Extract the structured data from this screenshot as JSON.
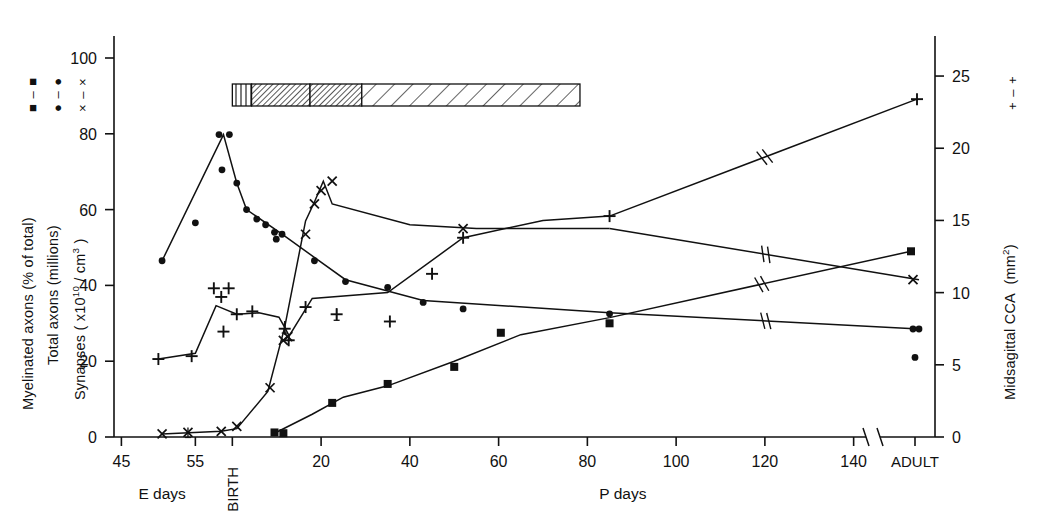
{
  "figure": {
    "background": "#ffffff",
    "ink": "#111111"
  },
  "axes": {
    "left": {
      "label_lines": [
        {
          "text": "Myelinated axons ( % of total )",
          "key": "square"
        },
        {
          "text": "Total axons (millions)",
          "key": "circle"
        },
        {
          "text": "Synapses ( x10^10 / cm^3 )",
          "key": "cross"
        }
      ],
      "ticks": [
        0,
        20,
        40,
        60,
        80,
        100
      ],
      "min": 0,
      "max": 105
    },
    "right": {
      "label": "Midsagittal CCA",
      "label_units": "(mm2)",
      "key": "plus",
      "ticks": [
        0,
        5,
        10,
        15,
        20,
        25
      ],
      "min": 0,
      "max": 26.25
    },
    "bottom": {
      "embryonic_label": "E days",
      "postnatal_label": "P days",
      "birth_label": "BIRTH",
      "adult_label": "ADULT",
      "e_ticks": [
        45,
        55
      ],
      "p_ticks": [
        20,
        40,
        60,
        80,
        100,
        120,
        140
      ],
      "has_break": true
    }
  },
  "legend_keys": {
    "square": "■ – ■",
    "circle": "● – ●",
    "cross": "× – ×",
    "plus": "+ – +"
  },
  "chart_data": {
    "type": "scatter",
    "title": "",
    "xlabel": "E days / P days",
    "ylabel": "Myelinated axons (% of total); Total axons (millions); Synapses (x10^10/cm^3)",
    "y2label": "Midsagittal CCA (mm2)",
    "xlim": [
      43,
      155
    ],
    "ylim": [
      0,
      105
    ],
    "y2lim": [
      0,
      26.25
    ],
    "grid": false,
    "legend_position": "left-rotated",
    "x_axis_note": "Embryonic days 45-55 then birth then postnatal days 0-150, axis break before ADULT",
    "series": [
      {
        "name": "Total axons (millions)",
        "marker": "circle",
        "axis": "left",
        "points": [
          {
            "x": 50.5,
            "y": 46.5
          },
          {
            "x": 55.0,
            "y": 56.5
          },
          {
            "x": 58.2,
            "y": 79.8
          },
          {
            "x": 59.6,
            "y": 79.8
          },
          {
            "x": 58.6,
            "y": 70.5
          },
          {
            "x": 61.0,
            "y": 67.0
          },
          {
            "x": 63.2,
            "y": 60.0
          },
          {
            "x": 65.5,
            "y": 57.5
          },
          {
            "x": 67.5,
            "y": 56.0
          },
          {
            "x": 69.5,
            "y": 54.0
          },
          {
            "x": 69.9,
            "y": 52.2
          },
          {
            "x": 71.2,
            "y": 53.5
          },
          {
            "x": 78.5,
            "y": 46.5
          },
          {
            "x": 85.5,
            "y": 41.0
          },
          {
            "x": 95.0,
            "y": 39.5
          },
          {
            "x": 103.0,
            "y": 35.5
          },
          {
            "x": 112.0,
            "y": 33.8
          },
          {
            "x": 145.0,
            "y": 32.5
          },
          {
            "x": 152.5,
            "y": 28.5
          },
          {
            "x": 154.0,
            "y": 28.5
          },
          {
            "x": 153.0,
            "y": 21.0
          }
        ],
        "line_through": [
          {
            "x": 50.5,
            "y": 46.5
          },
          {
            "x": 58.8,
            "y": 79.8
          },
          {
            "x": 61.0,
            "y": 67.0
          },
          {
            "x": 63.2,
            "y": 60.0
          },
          {
            "x": 71.2,
            "y": 53.5
          },
          {
            "x": 85.5,
            "y": 41.5
          },
          {
            "x": 103.0,
            "y": 36.0
          },
          {
            "x": 145.0,
            "y": 32.8
          },
          {
            "x": 154.0,
            "y": 28.5
          }
        ]
      },
      {
        "name": "Synapses (x10^10/cm^3)",
        "marker": "cross",
        "axis": "left",
        "points": [
          {
            "x": 50.5,
            "y": 0.8
          },
          {
            "x": 54.0,
            "y": 1.2
          },
          {
            "x": 58.5,
            "y": 1.5
          },
          {
            "x": 61.0,
            "y": 2.8
          },
          {
            "x": 68.5,
            "y": 13.0
          },
          {
            "x": 71.5,
            "y": 25.5
          },
          {
            "x": 72.5,
            "y": 26.5
          },
          {
            "x": 76.5,
            "y": 53.5
          },
          {
            "x": 78.5,
            "y": 61.5
          },
          {
            "x": 80.0,
            "y": 65.0
          },
          {
            "x": 82.5,
            "y": 67.5
          },
          {
            "x": 112.0,
            "y": 55.0
          },
          {
            "x": 152.5,
            "y": 41.5
          }
        ],
        "line_through": [
          {
            "x": 50.5,
            "y": 0.8
          },
          {
            "x": 58.5,
            "y": 1.5
          },
          {
            "x": 61.0,
            "y": 2.2
          },
          {
            "x": 68.0,
            "y": 12.0
          },
          {
            "x": 71.8,
            "y": 29.0
          },
          {
            "x": 76.5,
            "y": 57.0
          },
          {
            "x": 78.5,
            "y": 62.0
          },
          {
            "x": 80.5,
            "y": 67.5
          },
          {
            "x": 82.5,
            "y": 61.5
          },
          {
            "x": 100.0,
            "y": 56.0
          },
          {
            "x": 115.0,
            "y": 55.0
          },
          {
            "x": 145.0,
            "y": 55.0
          },
          {
            "x": 154.0,
            "y": 41.5
          }
        ]
      },
      {
        "name": "Myelinated axons (% of total)",
        "marker": "square",
        "axis": "left",
        "points": [
          {
            "x": 69.5,
            "y": 1.2
          },
          {
            "x": 71.5,
            "y": 1.0
          },
          {
            "x": 82.5,
            "y": 9.0
          },
          {
            "x": 95.0,
            "y": 14.0
          },
          {
            "x": 110.0,
            "y": 18.5
          },
          {
            "x": 120.5,
            "y": 27.5
          },
          {
            "x": 145.0,
            "y": 30.0
          },
          {
            "x": 152.0,
            "y": 49.0
          }
        ],
        "line_through": [
          {
            "x": 69.5,
            "y": 1.0
          },
          {
            "x": 78.0,
            "y": 6.0
          },
          {
            "x": 85.0,
            "y": 10.5
          },
          {
            "x": 95.0,
            "y": 13.5
          },
          {
            "x": 110.0,
            "y": 20.0
          },
          {
            "x": 125.0,
            "y": 27.0
          },
          {
            "x": 145.0,
            "y": 31.5
          },
          {
            "x": 152.0,
            "y": 49.0
          }
        ]
      },
      {
        "name": "Midsagittal CCA (mm2)",
        "marker": "plus",
        "axis": "right",
        "points": [
          {
            "x": 50.0,
            "y": 5.4
          },
          {
            "x": 54.5,
            "y": 5.6
          },
          {
            "x": 57.5,
            "y": 10.3
          },
          {
            "x": 59.5,
            "y": 10.3
          },
          {
            "x": 58.5,
            "y": 9.7
          },
          {
            "x": 58.8,
            "y": 7.3
          },
          {
            "x": 61.0,
            "y": 8.5
          },
          {
            "x": 64.5,
            "y": 8.7
          },
          {
            "x": 71.8,
            "y": 7.5
          },
          {
            "x": 72.7,
            "y": 6.7
          },
          {
            "x": 76.5,
            "y": 9.0
          },
          {
            "x": 83.5,
            "y": 8.5
          },
          {
            "x": 95.5,
            "y": 8.0
          },
          {
            "x": 105.0,
            "y": 11.3
          },
          {
            "x": 112.0,
            "y": 13.8
          },
          {
            "x": 145.0,
            "y": 15.3
          },
          {
            "x": 153.5,
            "y": 23.4
          }
        ],
        "line_through": [
          {
            "x": 50.0,
            "y": 5.4
          },
          {
            "x": 55.0,
            "y": 5.8
          },
          {
            "x": 57.8,
            "y": 9.1
          },
          {
            "x": 61.0,
            "y": 8.5
          },
          {
            "x": 66.0,
            "y": 8.6
          },
          {
            "x": 70.5,
            "y": 8.3
          },
          {
            "x": 71.8,
            "y": 7.6
          },
          {
            "x": 72.8,
            "y": 7.0
          },
          {
            "x": 78.0,
            "y": 9.6
          },
          {
            "x": 95.0,
            "y": 10.0
          },
          {
            "x": 112.0,
            "y": 13.8
          },
          {
            "x": 130.0,
            "y": 15.0
          },
          {
            "x": 145.0,
            "y": 15.3
          },
          {
            "x": 153.5,
            "y": 23.4
          }
        ]
      }
    ],
    "annotation_bar": {
      "description": "Horizontal hatched timeline bar above the plot",
      "y_value": 91,
      "x_start": 60.0,
      "x_end": 107.0,
      "segments": [
        {
          "pattern": "vertical-lines",
          "x_start": 60.0,
          "x_end": 62.6
        },
        {
          "pattern": "dense-diagonal",
          "x_start": 62.6,
          "x_end": 70.5
        },
        {
          "pattern": "dense-diagonal",
          "x_start": 70.5,
          "x_end": 77.5
        },
        {
          "pattern": "wide-diagonal",
          "x_start": 77.5,
          "x_end": 107.0
        }
      ]
    }
  }
}
